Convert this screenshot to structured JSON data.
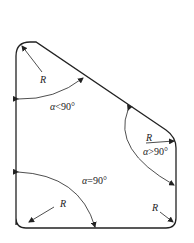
{
  "diagram": {
    "title": "",
    "colors": {
      "stroke": "#222222",
      "background": "#ffffff"
    },
    "corners": [
      {
        "id": "top-left",
        "radius_label": "R",
        "angle_label_symbol": "α",
        "angle_label_rel": "<",
        "angle_label_value": "90°"
      },
      {
        "id": "right",
        "radius_label": "R",
        "angle_label_symbol": "α",
        "angle_label_rel": ">",
        "angle_label_value": "90°"
      },
      {
        "id": "bottom-left",
        "radius_label": "R",
        "angle_label_symbol": "α",
        "angle_label_rel": "=",
        "angle_label_value": "90°"
      },
      {
        "id": "bottom-right",
        "radius_label": "R"
      }
    ]
  }
}
